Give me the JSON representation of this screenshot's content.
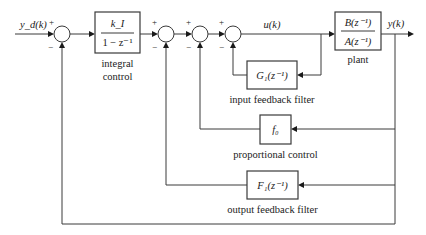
{
  "diagram": {
    "type": "block-diagram",
    "signals": {
      "reference": "y_d(k)",
      "control": "u(k)",
      "output": "y(k)"
    },
    "blocks": {
      "integral": {
        "numerator": "k_I",
        "denominator": "1 − z⁻¹",
        "label_line1": "integral",
        "label_line2": "control"
      },
      "plant": {
        "numerator": "B(z⁻¹)",
        "denominator": "A(z⁻¹)",
        "label": "plant"
      },
      "input_filter": {
        "content": "G₁(z⁻¹)",
        "label": "input feedback filter"
      },
      "proportional": {
        "content": "f₀",
        "label": "proportional control"
      },
      "output_filter": {
        "content": "F₁(z⁻¹)",
        "label": "output feedback filter"
      }
    },
    "summing_junctions": [
      {
        "id": "sum1",
        "plus": "+",
        "minus": "−"
      },
      {
        "id": "sum2",
        "plus": "+",
        "minus": "−"
      },
      {
        "id": "sum3",
        "plus": "+",
        "minus": "−"
      },
      {
        "id": "sum4",
        "plus": "+",
        "minus": "−"
      }
    ]
  }
}
